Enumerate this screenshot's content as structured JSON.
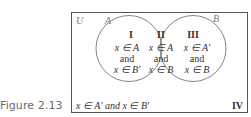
{
  "figure": {
    "caption": "Figure 2.13"
  },
  "diagram": {
    "universe_label": "U",
    "set_a_label": "A",
    "set_b_label": "B",
    "regions": [
      {
        "id": "I",
        "numeral": "I",
        "line1": "x ∈ A",
        "line2": "and",
        "line3": "x ∈ B′"
      },
      {
        "id": "II",
        "numeral": "II",
        "line1": "x ∈ A",
        "line2": "and",
        "line3": "x ∈ B"
      },
      {
        "id": "III",
        "numeral": "III",
        "line1": "x ∈ A′",
        "line2": "and",
        "line3": "x ∈ B"
      },
      {
        "id": "IV",
        "numeral": "IV",
        "text": "x ∈ A′ and x ∈ B′"
      }
    ]
  }
}
